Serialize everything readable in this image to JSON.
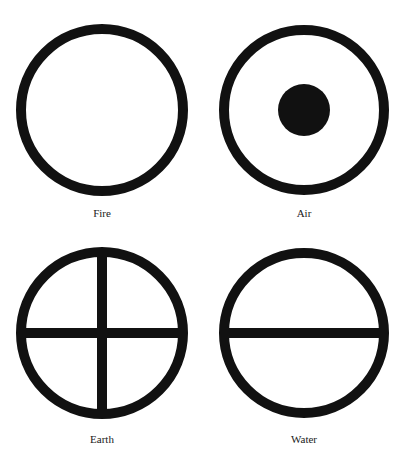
{
  "diagram": {
    "type": "classical-element-symbols",
    "stroke_color": "#111111",
    "background": "#ffffff",
    "elements": [
      {
        "name": "Fire",
        "label": "Fire",
        "symbol": "circle"
      },
      {
        "name": "Air",
        "label": "Air",
        "symbol": "circle-with-center-dot"
      },
      {
        "name": "Earth",
        "label": "Earth",
        "symbol": "circle-with-cross"
      },
      {
        "name": "Water",
        "label": "Water",
        "symbol": "circle-with-horizontal-line"
      }
    ]
  }
}
